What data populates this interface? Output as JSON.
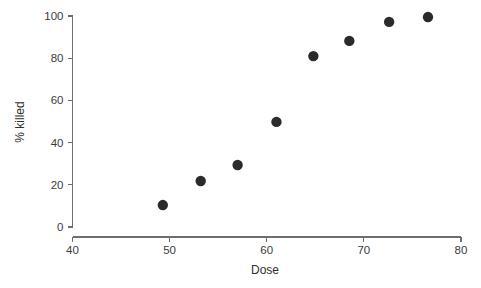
{
  "chart_data": {
    "type": "scatter",
    "title": "",
    "xlabel": "Dose",
    "ylabel": "% killed",
    "xlim": [
      40,
      80
    ],
    "ylim": [
      0,
      100
    ],
    "xticks": [
      40,
      50,
      60,
      70,
      80
    ],
    "yticks": [
      0,
      20,
      40,
      60,
      80,
      100
    ],
    "xtick_labels": [
      "40",
      "50",
      "60",
      "70",
      "80"
    ],
    "ytick_labels": [
      "0",
      "20",
      "40",
      "60",
      "80",
      "100"
    ],
    "grid": false,
    "legend": null,
    "marker": "circle",
    "marker_color": "#2b2b2b",
    "marker_size": 5.2,
    "series": [
      {
        "name": "observations",
        "x": [
          49.3,
          53.2,
          57.0,
          61.0,
          64.8,
          68.5,
          72.6,
          76.6
        ],
        "y": [
          10.4,
          21.8,
          29.4,
          49.8,
          81.0,
          88.2,
          97.2,
          99.5
        ]
      }
    ]
  },
  "style": {
    "background": "#ffffff",
    "axis_color": "#6e6e6e",
    "text_color": "#3b3b3b",
    "point_color": "#2b2b2b"
  }
}
